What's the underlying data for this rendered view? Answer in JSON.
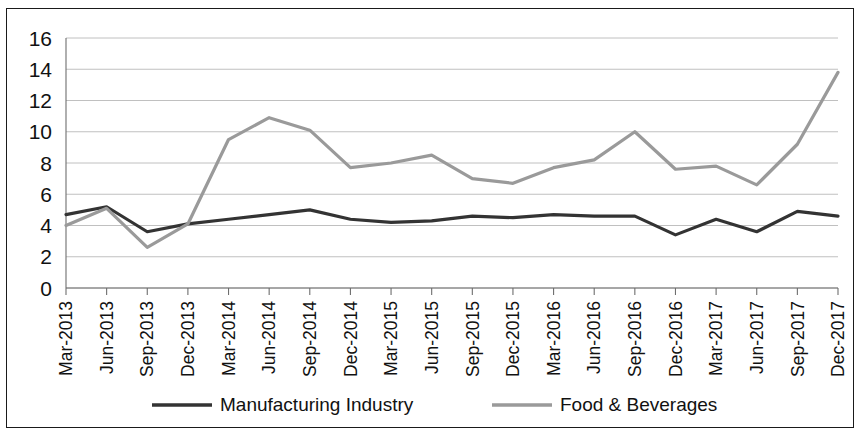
{
  "chart_data": {
    "type": "line",
    "title": "",
    "subtitle": "",
    "xlabel": "",
    "ylabel": "",
    "ylim": [
      0,
      16
    ],
    "ytick_step": 2,
    "yticks": [
      "0",
      "2",
      "4",
      "6",
      "8",
      "10",
      "12",
      "14",
      "16"
    ],
    "grid": true,
    "legend_position": "bottom",
    "categories": [
      "Mar-2013",
      "Jun-2013",
      "Sep-2013",
      "Dec-2013",
      "Mar-2014",
      "Jun-2014",
      "Sep-2014",
      "Dec-2014",
      "Mar-2015",
      "Jun-2015",
      "Sep-2015",
      "Dec-2015",
      "Mar-2016",
      "Jun-2016",
      "Sep-2016",
      "Dec-2016",
      "Mar-2017",
      "Jun-2017",
      "Sep-2017",
      "Dec-2017"
    ],
    "series": [
      {
        "name": "Manufacturing Industry",
        "color": "#333333",
        "width": 3.2,
        "values": [
          4.7,
          5.2,
          3.6,
          4.1,
          4.4,
          4.7,
          5.0,
          4.4,
          4.2,
          4.3,
          4.6,
          4.5,
          4.7,
          4.6,
          4.6,
          3.4,
          4.4,
          3.6,
          4.9,
          4.6
        ]
      },
      {
        "name": "Food & Beverages",
        "color": "#9a9a9a",
        "width": 3.2,
        "values": [
          4.0,
          5.1,
          2.6,
          4.1,
          9.5,
          10.9,
          10.1,
          7.7,
          8.0,
          8.5,
          7.0,
          6.7,
          7.7,
          8.2,
          10.0,
          7.6,
          7.8,
          6.6,
          9.2,
          13.8
        ]
      }
    ]
  },
  "legend": {
    "items": [
      {
        "label": "Manufacturing Industry",
        "color": "#333333"
      },
      {
        "label": "Food & Beverages",
        "color": "#9a9a9a"
      }
    ]
  }
}
